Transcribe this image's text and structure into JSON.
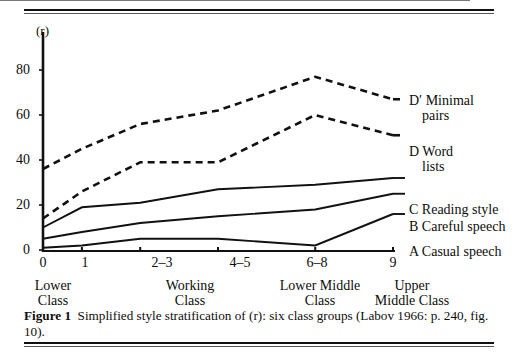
{
  "figure": {
    "caption_label": "Figure 1",
    "caption_text": "Simplified style stratification of (r): six class groups (Labov 1966: p. 240, fig. 10)."
  },
  "chart_data": {
    "type": "line",
    "title": "",
    "ylabel": "(r)",
    "xlabel": "",
    "ylim": [
      0,
      90
    ],
    "yticks": [
      0,
      20,
      40,
      60,
      80
    ],
    "ytick_labels": [
      "0",
      "20",
      "40",
      "60",
      "80"
    ],
    "x": [
      0,
      1,
      2.5,
      4.5,
      7,
      9
    ],
    "xtick_labels": [
      "0",
      "1",
      "2–3",
      "4–5",
      "6–8",
      "9"
    ],
    "x_group_labels": [
      {
        "line1": "Lower",
        "line2": "Class",
        "at": 0
      },
      {
        "line1": "Working",
        "line2": "Class",
        "at": 2.5
      },
      {
        "line1": "Lower Middle",
        "line2": "Class",
        "at": 7
      },
      {
        "line1": "Upper",
        "line2": "Middle Class",
        "at": 9
      }
    ],
    "grid": false,
    "legend_position": "right",
    "series": [
      {
        "key": "Dprime",
        "name": "D' Minimal pairs",
        "legend_line1": "D′ Minimal",
        "legend_line2": "pairs",
        "style": "dashed",
        "color": "#111111",
        "values": [
          36,
          45,
          56,
          62,
          77,
          67
        ]
      },
      {
        "key": "D",
        "name": "D Word lists",
        "legend_line1": "D Word",
        "legend_line2": "lists",
        "style": "dashed",
        "color": "#111111",
        "values": [
          14,
          26,
          39,
          39,
          60,
          51
        ]
      },
      {
        "key": "C",
        "name": "C Reading style",
        "legend_line1": "C Reading style",
        "legend_line2": "",
        "style": "solid",
        "color": "#111111",
        "values": [
          10,
          19,
          21,
          27,
          29,
          32
        ]
      },
      {
        "key": "B",
        "name": "B Careful speech",
        "legend_line1": "B Careful speech",
        "legend_line2": "",
        "style": "solid",
        "color": "#111111",
        "values": [
          5,
          8,
          12,
          15,
          18,
          25
        ]
      },
      {
        "key": "A",
        "name": "A Casual speech",
        "legend_line1": "A Casual speech",
        "legend_line2": "",
        "style": "solid",
        "color": "#111111",
        "values": [
          1,
          2,
          5,
          5,
          2,
          16
        ]
      }
    ]
  }
}
